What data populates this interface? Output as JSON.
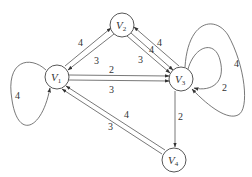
{
  "graph": {
    "nodes": [
      {
        "id": "V1",
        "label": "V",
        "sub": "1"
      },
      {
        "id": "V2",
        "label": "V",
        "sub": "2"
      },
      {
        "id": "V3",
        "label": "V",
        "sub": "3"
      },
      {
        "id": "V4",
        "label": "V",
        "sub": "4"
      }
    ],
    "edges": [
      {
        "from": "V1",
        "to": "V1",
        "weight": "4"
      },
      {
        "from": "V1",
        "to": "V2",
        "weight": "4"
      },
      {
        "from": "V2",
        "to": "V1",
        "weight": "3"
      },
      {
        "from": "V1",
        "to": "V3",
        "weight": "2"
      },
      {
        "from": "V1",
        "to": "V3",
        "weight": "3"
      },
      {
        "from": "V2",
        "to": "V3",
        "weight": "4"
      },
      {
        "from": "V2",
        "to": "V3",
        "weight": "3"
      },
      {
        "from": "V3",
        "to": "V2",
        "weight": "4"
      },
      {
        "from": "V3",
        "to": "V3",
        "weight": "2"
      },
      {
        "from": "V3",
        "to": "V3",
        "weight": "4"
      },
      {
        "from": "V3",
        "to": "V4",
        "weight": "2"
      },
      {
        "from": "V4",
        "to": "V1",
        "weight": "4"
      },
      {
        "from": "V4",
        "to": "V1",
        "weight": "3"
      }
    ]
  }
}
